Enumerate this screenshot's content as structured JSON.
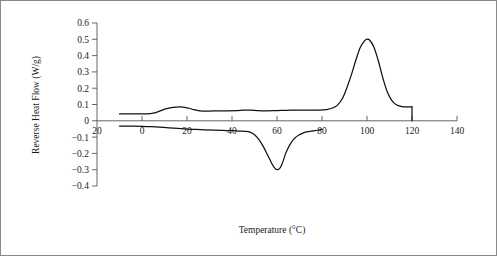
{
  "chart_data": {
    "type": "line",
    "title": "",
    "xlabel": "Temperature (°C)",
    "ylabel": "Reverse Heat Flow (W/g)",
    "xlim": [
      -20,
      140
    ],
    "ylim": [
      -0.4,
      0.6
    ],
    "xticks": [
      -20,
      0,
      20,
      40,
      60,
      80,
      100,
      120,
      140
    ],
    "xtick_labels": [
      "20",
      "0",
      "20",
      "40",
      "60",
      "80",
      "100",
      "120",
      "140"
    ],
    "xtick_labels_full": [
      "-20",
      "0",
      "20",
      "40",
      "60",
      "80",
      "100",
      "120",
      "140"
    ],
    "yticks": [
      0.6,
      0.5,
      0.4,
      0.3,
      0.2,
      0.1,
      0.0,
      -0.1,
      -0.2,
      -0.3,
      -0.4
    ],
    "ytick_labels": [
      "0.6",
      "0.5",
      "0.4",
      "0.3",
      "0.2",
      "0.1",
      "0",
      "−0.1",
      "−0.2",
      "−0.3",
      "−0.4"
    ],
    "grid": false,
    "legend": null,
    "legend_position": "none",
    "line_color": "#111111",
    "axis_color": "#555555",
    "background_color": "#ffffff",
    "series": [
      {
        "name": "upper-curve",
        "x": [
          -10,
          -6,
          -2,
          2,
          5,
          7,
          9,
          11,
          13,
          15,
          17,
          19,
          21,
          23,
          25,
          27,
          30,
          34,
          38,
          42,
          45,
          48,
          51,
          54,
          58,
          62,
          66,
          70,
          74,
          78,
          82,
          85,
          87,
          89,
          91,
          93,
          95,
          97,
          99,
          100,
          101,
          103,
          105,
          107,
          109,
          111,
          113,
          116,
          119,
          120,
          120
        ],
        "y": [
          0.042,
          0.042,
          0.042,
          0.043,
          0.047,
          0.055,
          0.066,
          0.075,
          0.081,
          0.084,
          0.085,
          0.083,
          0.077,
          0.068,
          0.062,
          0.06,
          0.06,
          0.061,
          0.061,
          0.062,
          0.065,
          0.065,
          0.063,
          0.061,
          0.062,
          0.064,
          0.065,
          0.066,
          0.066,
          0.066,
          0.069,
          0.08,
          0.098,
          0.135,
          0.2,
          0.28,
          0.37,
          0.45,
          0.492,
          0.5,
          0.497,
          0.455,
          0.37,
          0.265,
          0.178,
          0.125,
          0.098,
          0.086,
          0.085,
          0.086,
          0.0
        ]
      },
      {
        "name": "lower-curve",
        "x": [
          -10,
          -4,
          0,
          4,
          8,
          12,
          16,
          20,
          24,
          28,
          32,
          36,
          40,
          43,
          46,
          48,
          50,
          52,
          54,
          56,
          58,
          59,
          60,
          61,
          62,
          63,
          64,
          66,
          68,
          70,
          72,
          74,
          76,
          78,
          80
        ],
        "y": [
          -0.033,
          -0.033,
          -0.034,
          -0.036,
          -0.039,
          -0.043,
          -0.047,
          -0.051,
          -0.053,
          -0.055,
          -0.057,
          -0.059,
          -0.061,
          -0.063,
          -0.065,
          -0.07,
          -0.085,
          -0.115,
          -0.16,
          -0.215,
          -0.27,
          -0.29,
          -0.3,
          -0.295,
          -0.272,
          -0.235,
          -0.195,
          -0.14,
          -0.105,
          -0.085,
          -0.072,
          -0.066,
          -0.062,
          -0.058,
          -0.052
        ]
      }
    ],
    "annotations": [
      {
        "name": "end-of-scan-drop",
        "description": "Vertical drop of the upper curve at 120 °C down to the zero baseline",
        "x": 120,
        "y_from": 0.086,
        "y_to": 0.0
      },
      {
        "name": "exothermic-peak",
        "description": "Main peak maximum",
        "x": 100,
        "y": 0.5
      },
      {
        "name": "endothermic-trough",
        "description": "Main trough minimum",
        "x": 60,
        "y": -0.3
      },
      {
        "name": "low-temperature-shoulder",
        "description": "Small bump on upper curve",
        "x": 15,
        "y": 0.085
      }
    ]
  }
}
